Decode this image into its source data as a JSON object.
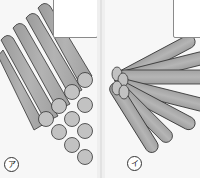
{
  "figure": {
    "panels": [
      {
        "id": "a",
        "label": "ア",
        "arrangement": "parallel hexagonal bundle of cylinders",
        "has_answer_box": true
      },
      {
        "id": "i",
        "label": "イ",
        "arrangement": "cylinders fanning out radially from a common end",
        "has_answer_box": true
      }
    ],
    "colors": {
      "cylinder_body": "#a9a9a9",
      "cylinder_end": "#c2c2c2",
      "outline": "#333333",
      "background": "#f7f7f7",
      "box_fill": "#ffffff",
      "gutter": "#efefef"
    }
  }
}
